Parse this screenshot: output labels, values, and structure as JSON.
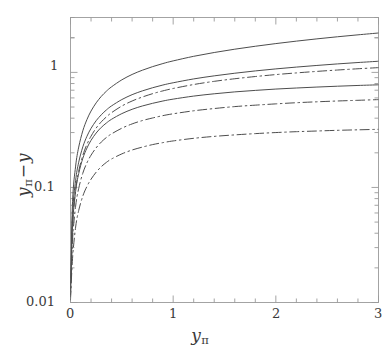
{
  "chart_data": {
    "type": "line",
    "title": "",
    "xlabel": "y_pi",
    "ylabel": "y_pi - y",
    "xlabel_base": "y",
    "xlabel_sub": "π",
    "ylabel_base": "y",
    "ylabel_sub": "π",
    "ylabel_minus": "−",
    "ylabel_tail": "y",
    "xscale": "linear",
    "yscale": "log",
    "xlim": [
      0,
      3
    ],
    "ylim": [
      0.01,
      3.0
    ],
    "grid": false,
    "legend": false,
    "legend_position": "none",
    "xticks": [
      0,
      1,
      2,
      3
    ],
    "xtick_labels": [
      "0",
      "1",
      "2",
      "3"
    ],
    "xminor_step": 0.2,
    "yticks": [
      0.01,
      0.1,
      1
    ],
    "ytick_labels": [
      "0.01",
      "0.1",
      "1"
    ],
    "yminor_decades": [
      2,
      3,
      4,
      5,
      6,
      7,
      8,
      9
    ],
    "line_color": "#4d4d4d",
    "axis_color": "#9a9a9a",
    "text_color": "#3a3a3a",
    "x": [
      0,
      0.02,
      0.05,
      0.08,
      0.12,
      0.16,
      0.2,
      0.25,
      0.3,
      0.35,
      0.4,
      0.5,
      0.6,
      0.7,
      0.8,
      0.9,
      1.0,
      1.2,
      1.4,
      1.6,
      1.8,
      2.0,
      2.2,
      2.4,
      2.6,
      2.8,
      3.0
    ],
    "series": [
      {
        "name": "curve-1-solid",
        "style": "solid",
        "y_at_x3": 2.2,
        "values": [
          0.01,
          0.053,
          0.108,
          0.158,
          0.219,
          0.274,
          0.325,
          0.383,
          0.436,
          0.484,
          0.528,
          0.607,
          0.676,
          0.736,
          0.791,
          0.841,
          0.887,
          0.972,
          1.049,
          1.121,
          1.189,
          1.254,
          1.317,
          1.378,
          1.437,
          1.494,
          1.55
        ]
      },
      {
        "name": "curve-2-solid",
        "style": "solid",
        "y_at_x3": 1.25,
        "values": [
          0.01,
          0.044,
          0.087,
          0.125,
          0.17,
          0.21,
          0.246,
          0.287,
          0.323,
          0.356,
          0.386,
          0.438,
          0.483,
          0.521,
          0.555,
          0.586,
          0.613,
          0.662,
          0.704,
          0.742,
          0.777,
          0.809,
          0.839,
          0.867,
          0.894,
          0.919,
          0.943
        ]
      },
      {
        "name": "curve-3-dashdot",
        "style": "dashdot",
        "y_at_x3": 1.1,
        "values": [
          0.01,
          0.04,
          0.081,
          0.118,
          0.162,
          0.202,
          0.238,
          0.28,
          0.317,
          0.35,
          0.381,
          0.435,
          0.481,
          0.521,
          0.557,
          0.589,
          0.618,
          0.669,
          0.713,
          0.751,
          0.785,
          0.816,
          0.844,
          0.87,
          0.894,
          0.917,
          0.938
        ]
      },
      {
        "name": "curve-4-solid",
        "style": "solid",
        "y_at_x3": 0.78,
        "values": [
          0.01,
          0.037,
          0.073,
          0.104,
          0.141,
          0.173,
          0.202,
          0.234,
          0.262,
          0.286,
          0.308,
          0.345,
          0.376,
          0.402,
          0.424,
          0.444,
          0.461,
          0.49,
          0.513,
          0.533,
          0.549,
          0.564,
          0.576,
          0.587,
          0.597,
          0.606,
          0.614
        ]
      },
      {
        "name": "curve-5-dashdot",
        "style": "dashdot",
        "y_at_x3": 0.58,
        "values": [
          0.01,
          0.031,
          0.061,
          0.087,
          0.118,
          0.145,
          0.169,
          0.196,
          0.22,
          0.241,
          0.259,
          0.29,
          0.316,
          0.338,
          0.356,
          0.373,
          0.387,
          0.411,
          0.43,
          0.447,
          0.46,
          0.472,
          0.483,
          0.492,
          0.5,
          0.507,
          0.514
        ]
      },
      {
        "name": "curve-6-dashdot",
        "style": "dashdot",
        "y_at_x3": 0.32,
        "values": [
          0.01,
          0.023,
          0.043,
          0.06,
          0.08,
          0.097,
          0.112,
          0.129,
          0.144,
          0.157,
          0.168,
          0.186,
          0.201,
          0.213,
          0.224,
          0.233,
          0.241,
          0.254,
          0.264,
          0.272,
          0.279,
          0.285,
          0.29,
          0.294,
          0.298,
          0.301,
          0.304
        ]
      }
    ]
  },
  "axes": {
    "ytick_0": "0.01",
    "ytick_1": "0.1",
    "ytick_2": "1",
    "xtick_0": "0",
    "xtick_1": "1",
    "xtick_2": "2",
    "xtick_3": "3"
  }
}
